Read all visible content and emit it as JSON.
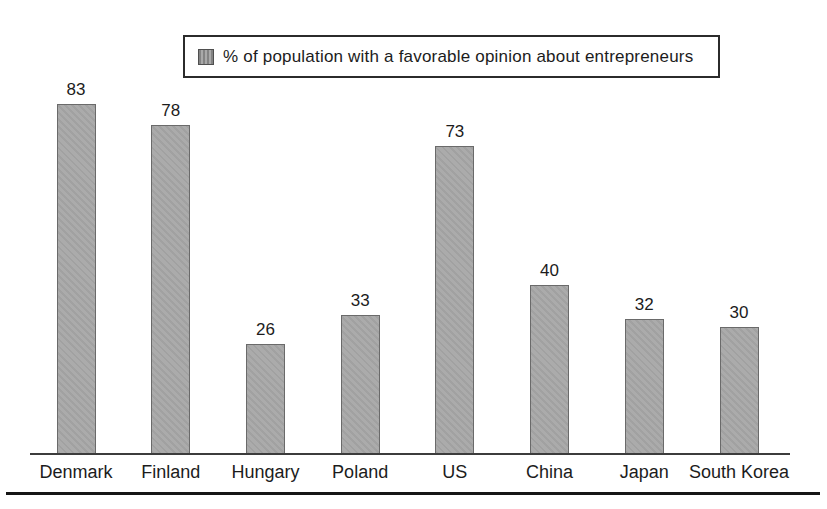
{
  "figure": {
    "background": "#ffffff",
    "bar_fill": "#ababab",
    "bar_border": "#6a6a6a",
    "axis_color": "#3c3c3c",
    "rule_color": "#161616",
    "text_color": "#1c1c1c"
  },
  "legend": {
    "label": "% of population with a favorable opinion about entrepreneurs",
    "swatch_color": "#a9a9a9"
  },
  "chart_data": {
    "type": "bar",
    "title": "",
    "categories": [
      "Denmark",
      "Finland",
      "Hungary",
      "Poland",
      "US",
      "China",
      "Japan",
      "South Korea"
    ],
    "values": [
      83,
      78,
      26,
      33,
      73,
      40,
      32,
      30
    ],
    "series_name": "% of population with a favorable opinion about entrepreneurs",
    "xlabel": "",
    "ylabel": "",
    "ylim": [
      0,
      100
    ],
    "grid": false,
    "legend_position": "top",
    "value_labels": true,
    "bar_color": "#ababab"
  }
}
